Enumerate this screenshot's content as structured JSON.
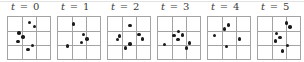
{
  "figure": {
    "grid": {
      "rows": 3,
      "cols": 3
    },
    "colors": {
      "background": "#ffffff",
      "grid_line": "#a3a3a3",
      "dot": "#1b1b1b",
      "label": "#3a3a3a",
      "top_rule": "#e4e4e4"
    },
    "panels": [
      {
        "label": {
          "lhs": "t",
          "op": "=",
          "rhs": "0"
        },
        "label_text": "t = 0",
        "dots": [
          [
            0.51,
            0.13
          ],
          [
            0.63,
            0.22
          ],
          [
            0.26,
            0.38
          ],
          [
            0.36,
            0.48
          ],
          [
            0.24,
            0.59
          ],
          [
            0.59,
            0.68
          ],
          [
            0.48,
            0.78
          ]
        ]
      },
      {
        "label": {
          "lhs": "t",
          "op": "=",
          "rhs": "1"
        },
        "label_text": "t = 1",
        "dots": [
          [
            0.37,
            0.17
          ],
          [
            0.6,
            0.42
          ],
          [
            0.69,
            0.52
          ],
          [
            0.56,
            0.61
          ],
          [
            0.23,
            0.69
          ]
        ]
      },
      {
        "label": {
          "lhs": "t",
          "op": "=",
          "rhs": "2"
        },
        "label_text": "t = 2",
        "dots": [
          [
            0.52,
            0.2
          ],
          [
            0.28,
            0.45
          ],
          [
            0.22,
            0.54
          ],
          [
            0.74,
            0.42
          ],
          [
            0.82,
            0.52
          ],
          [
            0.52,
            0.64
          ],
          [
            0.42,
            0.74
          ]
        ]
      },
      {
        "label": {
          "lhs": "t",
          "op": "=",
          "rhs": "3"
        },
        "label_text": "t = 3",
        "dots": [
          [
            0.49,
            0.34
          ],
          [
            0.38,
            0.44
          ],
          [
            0.58,
            0.43
          ],
          [
            0.48,
            0.53
          ],
          [
            0.16,
            0.65
          ],
          [
            0.75,
            0.62
          ],
          [
            0.68,
            0.74
          ]
        ]
      },
      {
        "label": {
          "lhs": "t",
          "op": "=",
          "rhs": "4"
        },
        "label_text": "t = 4",
        "dots": [
          [
            0.49,
            0.19
          ],
          [
            0.4,
            0.29
          ],
          [
            0.16,
            0.44
          ],
          [
            0.75,
            0.52
          ],
          [
            0.44,
            0.7
          ]
        ]
      },
      {
        "label": {
          "lhs": "t",
          "op": "=",
          "rhs": "5"
        },
        "label_text": "t = 5",
        "dots": [
          [
            0.68,
            0.14
          ],
          [
            0.76,
            0.24
          ],
          [
            0.44,
            0.4
          ],
          [
            0.52,
            0.49
          ],
          [
            0.41,
            0.57
          ],
          [
            0.7,
            0.68
          ],
          [
            0.59,
            0.81
          ]
        ]
      }
    ]
  }
}
